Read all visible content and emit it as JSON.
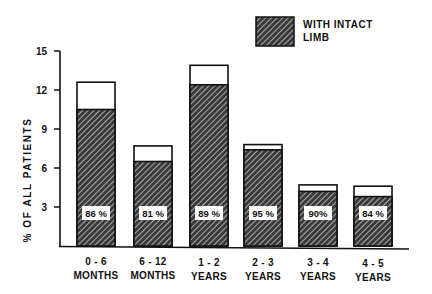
{
  "chart_data": {
    "type": "bar",
    "stacked": true,
    "title": "",
    "xlabel": "",
    "ylabel": "% OF ALL PATIENTS",
    "ylim": [
      0,
      15
    ],
    "yticks": [
      3,
      6,
      9,
      12,
      15
    ],
    "grid": false,
    "legend_position": "top-right",
    "legend": [
      {
        "label": "WITH INTACT LIMB",
        "pattern": "diagonal-hatch"
      }
    ],
    "categories": [
      [
        "0 - 6",
        "MONTHS"
      ],
      [
        "6 - 12",
        "MONTHS"
      ],
      [
        "1 - 2",
        "YEARS"
      ],
      [
        "2 - 3",
        "YEARS"
      ],
      [
        "3 - 4",
        "YEARS"
      ],
      [
        "4 - 5",
        "YEARS"
      ]
    ],
    "series": [
      {
        "name": "With intact limb",
        "values": [
          10.5,
          6.5,
          12.4,
          7.4,
          4.2,
          3.8
        ]
      },
      {
        "name": "Total",
        "values": [
          12.6,
          7.7,
          13.9,
          7.8,
          4.7,
          4.6
        ]
      }
    ],
    "annotations": [
      "86 %",
      "81 %",
      "89 %",
      "95 %",
      "90%",
      "84 %"
    ],
    "colors": {
      "ink": "#111111",
      "background": "#ffffff"
    }
  }
}
